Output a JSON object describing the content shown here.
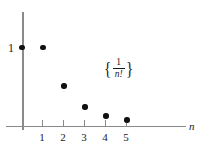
{
  "chart_data": {
    "type": "scatter",
    "title": "",
    "subtitle": "",
    "xlabel": "n",
    "ylabel": "",
    "annotation": "{1/n!}",
    "annotation_parts": {
      "open_brace": "{",
      "numerator": "1",
      "denominator": "n!",
      "close_brace": "}"
    },
    "x": [
      0,
      1,
      2,
      3,
      4,
      5
    ],
    "values": [
      1,
      1,
      0.5,
      0.1667,
      0.0417,
      0.0083
    ],
    "xticks": [
      1,
      2,
      3,
      4,
      5
    ],
    "xtick_labels": [
      "1",
      "2",
      "3",
      "4",
      "5"
    ],
    "yticks": [
      1
    ],
    "ytick_labels": [
      "1"
    ],
    "xlim": [
      -0.8,
      7.8
    ],
    "ylim": [
      0,
      1.45
    ],
    "grid": false,
    "legend": "none",
    "point_color": "#111111",
    "axis_color": "#8a8a8a"
  },
  "points": [
    {
      "label": "point-n0",
      "x": 22,
      "y": 47.5
    },
    {
      "label": "point-n1",
      "x": 43,
      "y": 47.5
    },
    {
      "label": "point-n2",
      "x": 64,
      "y": 86
    },
    {
      "label": "point-n3",
      "x": 85,
      "y": 107
    },
    {
      "label": "point-n4",
      "x": 106,
      "y": 116
    },
    {
      "label": "point-n5",
      "x": 127,
      "y": 120
    }
  ],
  "ticks": [
    {
      "label": "1",
      "x": 42
    },
    {
      "label": "2",
      "x": 63
    },
    {
      "label": "3",
      "x": 84
    },
    {
      "label": "4",
      "x": 105
    },
    {
      "label": "5",
      "x": 126
    }
  ]
}
